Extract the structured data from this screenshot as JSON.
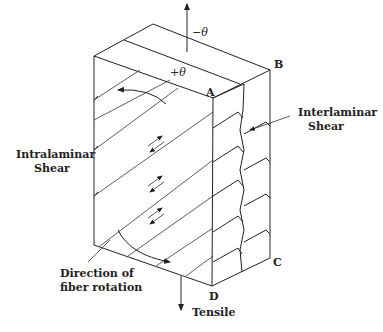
{
  "diagram": {
    "labels": {
      "minus_theta": "−θ",
      "plus_theta": "+θ",
      "corner_a": "A",
      "corner_b": "B",
      "corner_c": "C",
      "corner_d": "D",
      "interlaminar_line1": "Interlaminar",
      "interlaminar_line2": "Shear",
      "intralaminar_line1": "Intralaminar",
      "intralaminar_line2": "Shear",
      "rotation_line1": "Direction of",
      "rotation_line2": "fiber rotation",
      "tensile": "Tensile"
    },
    "colors": {
      "line": "#222222",
      "background": "#ffffff"
    }
  }
}
